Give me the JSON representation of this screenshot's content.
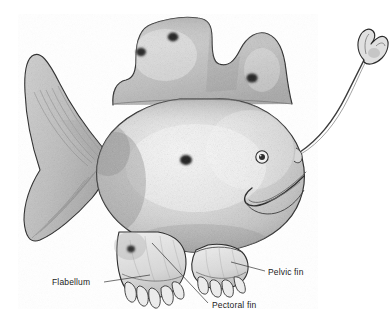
{
  "figure": {
    "medium": "pencil stipple drawing",
    "background_color": "#ffffff",
    "ink_color": "#1b1b1b",
    "body_tone_light": "#e6e6e6",
    "body_tone_mid": "#bfbfbf",
    "body_tone_dark": "#8f8f8f",
    "spot_color": "#2a2a2a"
  },
  "labels": [
    {
      "id": "flabellum",
      "text": "Flabellum",
      "text_x": 52,
      "text_y": 285,
      "leader_points": "104,282 150,275"
    },
    {
      "id": "pectoral-fin",
      "text": "Pectoral fin",
      "text_x": 212,
      "text_y": 308,
      "leader_points": "208,303 152,243"
    },
    {
      "id": "pelvic-fin",
      "text": "Pelvic fin",
      "text_x": 268,
      "text_y": 275,
      "leader_points": "265,271 231,262"
    }
  ],
  "anatomy": {
    "illicium_label": "illicium",
    "esca_label": "esca",
    "eye_label": "eye",
    "mouth_label": "mouth",
    "caudal_fin_label": "caudal fin",
    "dorsal_lobes_label": "dorsal lobes",
    "spots_count": 5
  },
  "spots": [
    {
      "cx": 141,
      "cy": 52,
      "rx": 5.0,
      "ry": 4.2
    },
    {
      "cx": 173,
      "cy": 37,
      "rx": 5.4,
      "ry": 4.4
    },
    {
      "cx": 252,
      "cy": 78,
      "rx": 5.6,
      "ry": 4.6
    },
    {
      "cx": 186,
      "cy": 160,
      "rx": 6.0,
      "ry": 5.0
    },
    {
      "cx": 131,
      "cy": 249,
      "rx": 4.0,
      "ry": 3.4
    }
  ]
}
